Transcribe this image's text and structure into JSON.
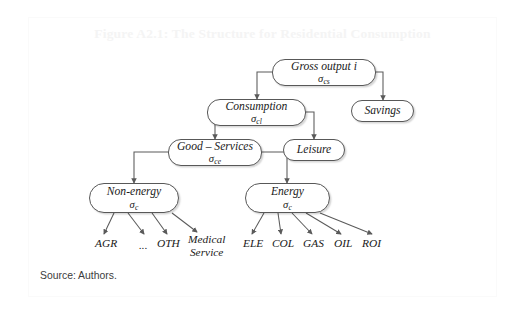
{
  "figure": {
    "title": "Figure A2.1: The Structure for Residential Consumption",
    "source_note": "Source: Authors.",
    "title_color": "#f4f4f4",
    "node_border_color": "#585858",
    "arrow_color": "#5a5a5a"
  },
  "diagram_data": {
    "type": "tree-diagram",
    "nodes": [
      {
        "id": "gross-output",
        "label": "Gross output i",
        "sigma": "σ",
        "sigma_sub": "cs",
        "x": 272,
        "y": 59,
        "w": 104,
        "h": 27
      },
      {
        "id": "consumption",
        "label": "Consumption",
        "sigma": "σ",
        "sigma_sub": "cl",
        "x": 207,
        "y": 99,
        "w": 99,
        "h": 27
      },
      {
        "id": "savings",
        "label": "Savings",
        "sigma": "",
        "sigma_sub": "",
        "x": 351,
        "y": 100,
        "w": 63,
        "h": 22
      },
      {
        "id": "good-services",
        "label": "Good – Services",
        "sigma": "σ",
        "sigma_sub": "ce",
        "x": 168,
        "y": 139,
        "w": 94,
        "h": 27
      },
      {
        "id": "leisure",
        "label": "Leisure",
        "sigma": "",
        "sigma_sub": "",
        "x": 283,
        "y": 139,
        "w": 62,
        "h": 22
      },
      {
        "id": "non-energy",
        "label": "Non-energy",
        "sigma": "σ",
        "sigma_sub": "c",
        "x": 89,
        "y": 183,
        "w": 90,
        "h": 30
      },
      {
        "id": "energy",
        "label": "Energy",
        "sigma": "σ",
        "sigma_sub": "c",
        "x": 245,
        "y": 183,
        "w": 85,
        "h": 30
      }
    ],
    "leaves_non_energy": [
      {
        "id": "agr",
        "label": "AGR",
        "lines": [
          "AGR"
        ],
        "x": 95,
        "y": 237
      },
      {
        "id": "ellipsis",
        "label": "...",
        "lines": [
          "..."
        ],
        "x": 139,
        "y": 239
      },
      {
        "id": "oth",
        "label": "OTH",
        "lines": [
          "OTH"
        ],
        "x": 157,
        "y": 237
      },
      {
        "id": "medical-service",
        "label": "Medical Service",
        "lines": [
          "Medical",
          "Service"
        ],
        "x": 188,
        "y": 233
      }
    ],
    "leaves_energy": [
      {
        "id": "ele",
        "label": "ELE",
        "lines": [
          "ELE"
        ],
        "x": 243,
        "y": 237
      },
      {
        "id": "col",
        "label": "COL",
        "lines": [
          "COL"
        ],
        "x": 272,
        "y": 237
      },
      {
        "id": "gas",
        "label": "GAS",
        "lines": [
          "GAS"
        ],
        "x": 303,
        "y": 237
      },
      {
        "id": "oil",
        "label": "OIL",
        "lines": [
          "OIL"
        ],
        "x": 334,
        "y": 237
      },
      {
        "id": "roi",
        "label": "ROI",
        "lines": [
          "ROI"
        ],
        "x": 362,
        "y": 237
      }
    ],
    "edges": [
      {
        "from": "gross-output",
        "to": "consumption",
        "style": "orthogonal-left"
      },
      {
        "from": "gross-output",
        "to": "savings",
        "style": "orthogonal-right"
      },
      {
        "from": "consumption",
        "to": "good-services",
        "style": "orthogonal-left"
      },
      {
        "from": "consumption",
        "to": "leisure",
        "style": "orthogonal-right"
      },
      {
        "from": "good-services",
        "to": "non-energy",
        "style": "orthogonal-left"
      },
      {
        "from": "good-services",
        "to": "energy",
        "style": "orthogonal-right"
      },
      {
        "from": "non-energy",
        "to": "agr",
        "style": "diagonal"
      },
      {
        "from": "non-energy",
        "to": "ellipsis",
        "style": "diagonal"
      },
      {
        "from": "non-energy",
        "to": "oth",
        "style": "diagonal"
      },
      {
        "from": "non-energy",
        "to": "medical-service",
        "style": "diagonal"
      },
      {
        "from": "energy",
        "to": "ele",
        "style": "diagonal"
      },
      {
        "from": "energy",
        "to": "col",
        "style": "diagonal"
      },
      {
        "from": "energy",
        "to": "gas",
        "style": "diagonal"
      },
      {
        "from": "energy",
        "to": "oil",
        "style": "diagonal"
      },
      {
        "from": "energy",
        "to": "roi",
        "style": "diagonal"
      }
    ]
  }
}
